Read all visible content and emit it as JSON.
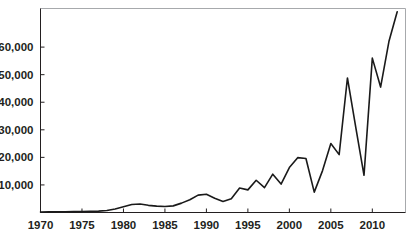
{
  "chart_data": {
    "type": "line",
    "title": "",
    "subtitle": "",
    "xlabel": "",
    "ylabel": "",
    "grid": false,
    "legend": false,
    "legend_position": "none",
    "line_color": "#1a1a1a",
    "background_color": "#ffffff",
    "border_color": "#a7a9ac",
    "xlim": [
      1970,
      2014
    ],
    "ylim": [
      0,
      74000
    ],
    "xticks": [
      1970,
      1975,
      1980,
      1985,
      1990,
      1995,
      2000,
      2005,
      2010
    ],
    "xtick_labels": [
      "1970",
      "1975",
      "1980",
      "1985",
      "1990",
      "1995",
      "2000",
      "2005",
      "2010"
    ],
    "yticks": [
      10000,
      20000,
      30000,
      40000,
      50000,
      60000
    ],
    "ytick_labels": [
      "10,000",
      "20,000",
      "30,000",
      "40,000",
      "50,000",
      "60,000"
    ],
    "x": [
      1970,
      1971,
      1972,
      1973,
      1974,
      1975,
      1976,
      1977,
      1978,
      1979,
      1980,
      1981,
      1982,
      1983,
      1984,
      1985,
      1986,
      1987,
      1988,
      1989,
      1990,
      1991,
      1992,
      1993,
      1994,
      1995,
      1996,
      1997,
      1998,
      1999,
      2000,
      2001,
      2002,
      2003,
      2004,
      2005,
      2006,
      2007,
      2008,
      2009,
      2010,
      2011,
      2012,
      2013
    ],
    "values": [
      200,
      220,
      250,
      260,
      300,
      350,
      420,
      500,
      700,
      1300,
      2100,
      2900,
      3100,
      2600,
      2300,
      2200,
      2400,
      3400,
      4600,
      6300,
      6600,
      5200,
      4000,
      5000,
      8900,
      8200,
      11700,
      9000,
      13900,
      10300,
      16300,
      19900,
      19600,
      7400,
      15200,
      25000,
      21000,
      48800,
      31000,
      13500,
      56000,
      45500,
      62000,
      72800
    ],
    "series_name": "value"
  },
  "axes": {
    "x_axis_name": "year-axis",
    "y_axis_name": "value-axis"
  }
}
